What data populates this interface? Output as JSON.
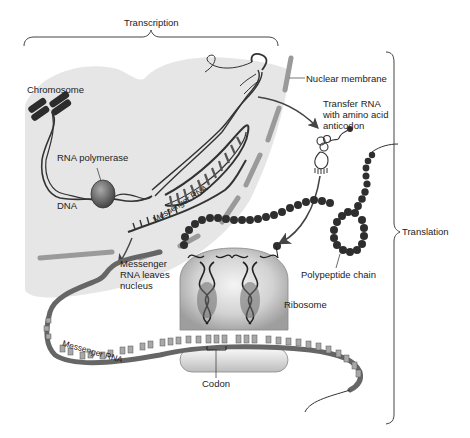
{
  "diagram": {
    "regions": {
      "transcription": "Transcription",
      "translation": "Translation"
    },
    "labels": {
      "chromosome": "Chromosome",
      "rna_polymerase": "RNA polymerase",
      "dna": "DNA",
      "messenger_rna_nucleus": "Messenger RNA",
      "nuclear_membrane": "Nuclear membrane",
      "trna_line1": "Transfer RNA",
      "trna_line2": "with amino acid",
      "trna_line3": "anticodon",
      "mrna_leaves_line1": "Messenger",
      "mrna_leaves_line2": "RNA leaves",
      "mrna_leaves_line3": "nucleus",
      "polypeptide_chain": "Polypeptide chain",
      "ribosome": "Ribosome",
      "messenger_rna_cytoplasm": "Messenger RNA",
      "codon": "Codon"
    },
    "colors": {
      "nucleus_fill": "#e6e6e6",
      "membrane": "#9a9a9a",
      "strand": "#333333",
      "bead": "#2e2e2e",
      "ribosome": "#cfcfcf",
      "text": "#222222",
      "background": "#ffffff"
    }
  }
}
